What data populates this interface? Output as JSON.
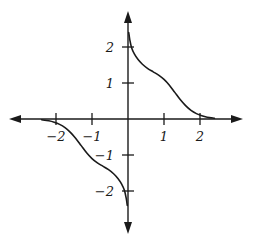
{
  "figure": {
    "width": 253,
    "height": 245,
    "background": "#ffffff",
    "ink_color": "#1a1a1a"
  },
  "chart_data": {
    "type": "line",
    "title": "",
    "subtitle": "",
    "xlabel": "",
    "ylabel": "",
    "xlim": [
      -2.6,
      2.6
    ],
    "ylim": [
      -2.6,
      2.6
    ],
    "grid": false,
    "legend": null,
    "legend_position": "none",
    "axes": {
      "x_axis": {
        "tick_values": [
          -2,
          -1,
          1,
          2
        ],
        "tick_labels": [
          "−2",
          "−1",
          "1",
          "2"
        ],
        "arrows": [
          "left",
          "right"
        ]
      },
      "y_axis": {
        "tick_values": [
          -2,
          -1,
          1,
          2
        ],
        "tick_labels": [
          "−2",
          "−1",
          "1",
          "2"
        ],
        "arrows": [
          "up",
          "down"
        ]
      }
    },
    "series": [
      {
        "name": "curve",
        "color": "#1a1a1a",
        "x": [
          -2.45,
          -2.3,
          -2.15,
          -2.0,
          -1.85,
          -1.7,
          -1.55,
          -1.4,
          -1.25,
          -1.1,
          -0.95,
          -0.8,
          -0.65,
          -0.5,
          -0.35,
          -0.2,
          -0.1,
          -0.04,
          0.0,
          0.04,
          0.1,
          0.2,
          0.35,
          0.5,
          0.65,
          0.8,
          0.95,
          1.1,
          1.25,
          1.4,
          1.55,
          1.7,
          1.85,
          2.0,
          2.15,
          2.3,
          2.45
        ],
        "y": [
          0.02,
          0.04,
          0.07,
          0.12,
          0.22,
          0.38,
          0.58,
          0.8,
          0.99,
          1.12,
          1.2,
          1.25,
          1.3,
          1.37,
          1.5,
          1.78,
          2.02,
          2.22,
          2.4,
          -2.4,
          -2.22,
          -2.02,
          -1.78,
          -1.5,
          -1.37,
          -1.3,
          -1.25,
          -1.2,
          -1.12,
          -0.99,
          -0.8,
          -0.58,
          -0.38,
          -0.22,
          -0.12,
          -0.07,
          -0.04
        ],
        "branches": [
          {
            "name": "upper-right-branch",
            "x": [
              0.02,
              0.05,
              0.1,
              0.18,
              0.28,
              0.4,
              0.55,
              0.7,
              0.85,
              1.0,
              1.15,
              1.3,
              1.45,
              1.6,
              1.75,
              1.9,
              2.05,
              2.2,
              2.4
            ],
            "y": [
              2.4,
              2.2,
              1.98,
              1.8,
              1.65,
              1.52,
              1.4,
              1.31,
              1.22,
              1.1,
              0.94,
              0.74,
              0.54,
              0.37,
              0.24,
              0.15,
              0.09,
              0.05,
              0.02
            ]
          },
          {
            "name": "lower-left-branch",
            "x": [
              -0.02,
              -0.05,
              -0.1,
              -0.18,
              -0.28,
              -0.4,
              -0.55,
              -0.7,
              -0.85,
              -1.0,
              -1.15,
              -1.3,
              -1.45,
              -1.6,
              -1.75,
              -1.9,
              -2.05,
              -2.2,
              -2.4
            ],
            "y": [
              -2.4,
              -2.2,
              -1.98,
              -1.8,
              -1.65,
              -1.52,
              -1.4,
              -1.31,
              -1.22,
              -1.1,
              -0.94,
              -0.74,
              -0.54,
              -0.37,
              -0.24,
              -0.15,
              -0.09,
              -0.05,
              -0.02
            ]
          }
        ]
      }
    ]
  }
}
